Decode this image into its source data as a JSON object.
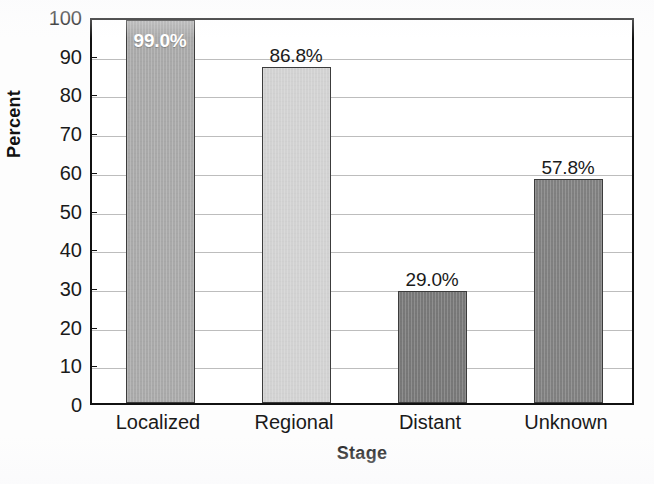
{
  "chart_data": {
    "type": "bar",
    "title": "",
    "subtitle": "",
    "xlabel": "Stage",
    "ylabel": "Percent",
    "categories": [
      "Localized",
      "Regional",
      "Distant",
      "Unknown"
    ],
    "values": [
      99.0,
      86.8,
      29.0,
      57.8
    ],
    "data_labels": [
      "99.0%",
      "86.8%",
      "29.0%",
      "57.8%"
    ],
    "label_placement": [
      "inside",
      "outside",
      "outside",
      "outside"
    ],
    "bar_colors": [
      "#a9a9a9",
      "#d2d2d2",
      "#787878",
      "#808080"
    ],
    "bar_edge_color": "#3c3c3c",
    "ylim": [
      0,
      100
    ],
    "ytick_step": 10,
    "ytick_labels": [
      "100",
      "90",
      "80",
      "70",
      "60",
      "50",
      "40",
      "30",
      "20",
      "10",
      "0"
    ],
    "ytick_values": [
      100,
      90,
      80,
      70,
      60,
      50,
      40,
      30,
      20,
      10,
      0
    ],
    "grid": true,
    "grid_color": "#bdbdbd",
    "grid_axis": "y",
    "legend": false,
    "legend_position": "none",
    "frame_color": "#111111",
    "plot_background": "#ffffff"
  }
}
